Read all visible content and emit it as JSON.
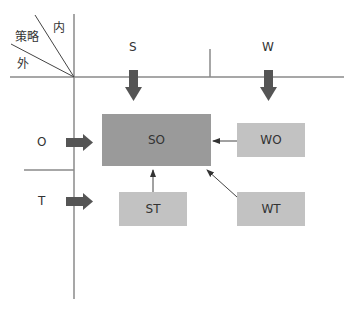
{
  "corner": {
    "inner": "内",
    "strategy": "策略",
    "outer": "外"
  },
  "columns": [
    {
      "label": "S"
    },
    {
      "label": "W"
    }
  ],
  "rows": [
    {
      "label": "O"
    },
    {
      "label": "T"
    }
  ],
  "boxes": {
    "so": "SO",
    "wo": "WO",
    "st": "ST",
    "wt": "WT"
  },
  "colors": {
    "so_fill": "#9a9a9a",
    "sub_fill": "#c2c2c2",
    "thick_arrow": "#555555",
    "line": "#888888"
  }
}
